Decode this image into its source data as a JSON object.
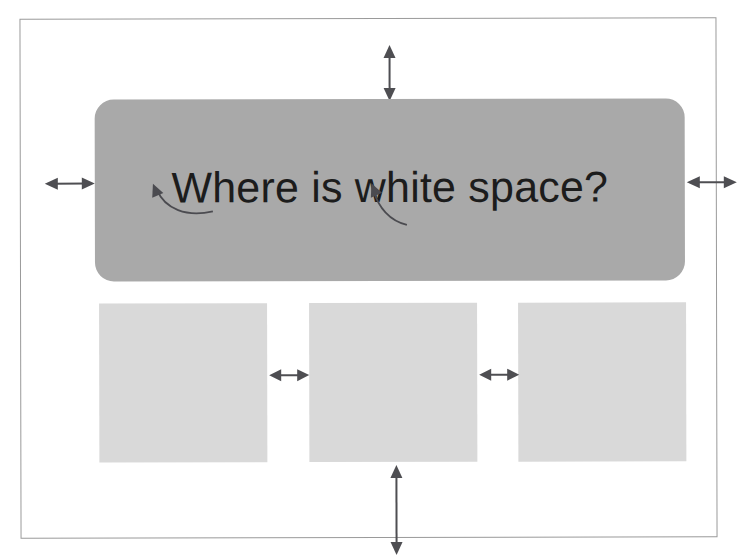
{
  "slide": {
    "name": "white-space-slide",
    "background_color": "#ffffff",
    "frame_border_color": "#9a9a9a"
  },
  "headline": {
    "text": "Where is white space?",
    "panel_color": "#a9a9a9",
    "text_color": "#1c1c1c"
  },
  "content_boxes": [
    {
      "label": "",
      "color": "#d9d9d9"
    },
    {
      "label": "",
      "color": "#d9d9d9"
    },
    {
      "label": "",
      "color": "#d9d9d9"
    }
  ],
  "arrows": {
    "color": "#4e4e52",
    "markers": [
      {
        "name": "top-margin-arrow",
        "orientation": "vertical",
        "label": ""
      },
      {
        "name": "left-margin-arrow",
        "orientation": "horizontal",
        "label": ""
      },
      {
        "name": "right-margin-arrow",
        "orientation": "horizontal",
        "label": ""
      },
      {
        "name": "gap-arrow-box1-box2",
        "orientation": "horizontal",
        "label": ""
      },
      {
        "name": "gap-arrow-box2-box3",
        "orientation": "horizontal",
        "label": ""
      },
      {
        "name": "bottom-margin-arrow",
        "orientation": "vertical",
        "label": ""
      }
    ],
    "callouts": [
      {
        "name": "callout-arrow-word-where",
        "label": ""
      },
      {
        "name": "callout-arrow-word-white",
        "label": ""
      }
    ]
  }
}
